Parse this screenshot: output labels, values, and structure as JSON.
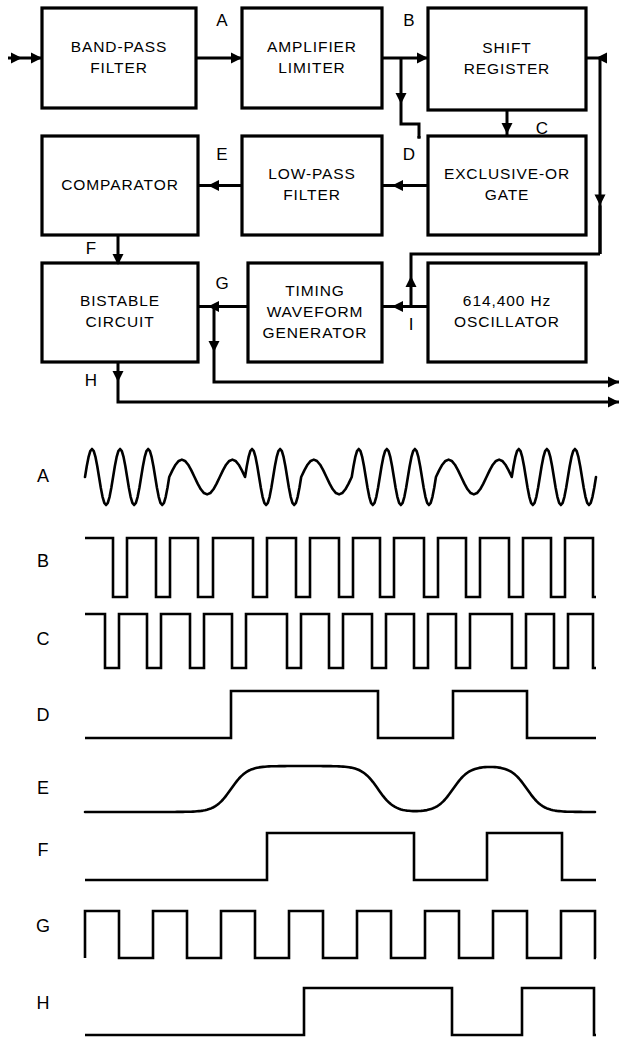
{
  "figure": {
    "kind": "block-diagram-with-timing-waveforms",
    "line_color": "#000000",
    "background_color": "#ffffff"
  },
  "block_diagram": {
    "blocks": [
      {
        "id": "band-pass-filter",
        "lines": [
          "BAND-PASS",
          "FILTER"
        ],
        "x": 42,
        "y": 8,
        "w": 154,
        "h": 100
      },
      {
        "id": "amplifier-limiter",
        "lines": [
          "AMPLIFIER",
          "LIMITER"
        ],
        "x": 242,
        "y": 8,
        "w": 140,
        "h": 100
      },
      {
        "id": "shift-register",
        "lines": [
          "SHIFT",
          "REGISTER"
        ],
        "x": 428,
        "y": 8,
        "w": 158,
        "h": 102
      },
      {
        "id": "comparator",
        "lines": [
          "COMPARATOR"
        ],
        "x": 42,
        "y": 136,
        "w": 156,
        "h": 99
      },
      {
        "id": "low-pass-filter",
        "lines": [
          "LOW-PASS",
          "FILTER"
        ],
        "x": 242,
        "y": 136,
        "w": 140,
        "h": 99
      },
      {
        "id": "exclusive-or-gate",
        "lines": [
          "EXCLUSIVE-OR",
          "GATE"
        ],
        "x": 428,
        "y": 136,
        "w": 158,
        "h": 99
      },
      {
        "id": "bistable-circuit",
        "lines": [
          "BISTABLE",
          "CIRCUIT"
        ],
        "x": 42,
        "y": 263,
        "w": 156,
        "h": 99
      },
      {
        "id": "timing-waveform-generator",
        "lines": [
          "TIMING",
          "WAVEFORM",
          "GENERATOR"
        ],
        "x": 248,
        "y": 263,
        "w": 134,
        "h": 99
      },
      {
        "id": "oscillator",
        "lines": [
          "614,400   Hz",
          "OSCILLATOR"
        ],
        "x": 428,
        "y": 263,
        "w": 158,
        "h": 99
      }
    ],
    "node_labels": [
      {
        "id": "node-a",
        "text": "A",
        "x": 222,
        "y": 22
      },
      {
        "id": "node-b",
        "text": "B",
        "x": 409,
        "y": 22
      },
      {
        "id": "node-c",
        "text": "C",
        "x": 542,
        "y": 130
      },
      {
        "id": "node-d",
        "text": "D",
        "x": 409,
        "y": 156
      },
      {
        "id": "node-e",
        "text": "E",
        "x": 222,
        "y": 156
      },
      {
        "id": "node-f",
        "text": "F",
        "x": 91,
        "y": 250
      },
      {
        "id": "node-g",
        "text": "G",
        "x": 222,
        "y": 285
      },
      {
        "id": "node-h",
        "text": "H",
        "x": 91,
        "y": 382
      },
      {
        "id": "node-i",
        "text": "I",
        "x": 411,
        "y": 326
      }
    ],
    "signal_flow": [
      "input → BAND-PASS FILTER",
      "BAND-PASS FILTER → A → AMPLIFIER LIMITER",
      "AMPLIFIER LIMITER → B → SHIFT REGISTER",
      "B → EXCLUSIVE-OR GATE",
      "SHIFT REGISTER → C → EXCLUSIVE-OR GATE",
      "EXCLUSIVE-OR GATE → D → LOW-PASS FILTER",
      "LOW-PASS FILTER → E → COMPARATOR",
      "COMPARATOR → F → BISTABLE CIRCUIT",
      "TIMING WAVEFORM GENERATOR → G → BISTABLE CIRCUIT",
      "614,400 Hz OSCILLATOR → I → TIMING WAVEFORM GENERATOR",
      "TIMING WAVEFORM GENERATOR → SHIFT REGISTER (clock)",
      "G → output",
      "BISTABLE CIRCUIT → H → output"
    ]
  },
  "waveforms": {
    "labels": [
      {
        "id": "wave-a",
        "text": "A",
        "x": 43,
        "y": 477
      },
      {
        "id": "wave-b",
        "text": "B",
        "x": 43,
        "y": 562
      },
      {
        "id": "wave-c",
        "text": "C",
        "x": 43,
        "y": 640
      },
      {
        "id": "wave-d",
        "text": "D",
        "x": 43,
        "y": 716
      },
      {
        "id": "wave-e",
        "text": "E",
        "x": 43,
        "y": 789
      },
      {
        "id": "wave-f",
        "text": "F",
        "x": 43,
        "y": 851
      },
      {
        "id": "wave-g",
        "text": "G",
        "x": 43,
        "y": 927
      },
      {
        "id": "wave-h",
        "text": "H",
        "x": 43,
        "y": 1004
      }
    ]
  },
  "chart_data": {
    "type": "line",
    "title": "",
    "xlabel": "",
    "ylabel": "",
    "x_range": [
      85,
      596
    ],
    "traces": [
      {
        "name": "A",
        "kind": "analog-sine-fsk",
        "baseline_y": 477,
        "amplitude": 28,
        "description": "Frequency-shift-keyed sine wave; alternating high-frequency and low-frequency bursts",
        "segments": [
          {
            "cycles": 3.0,
            "rel_freq": "high"
          },
          {
            "cycles": 1.5,
            "rel_freq": "low"
          },
          {
            "cycles": 2.0,
            "rel_freq": "high"
          },
          {
            "cycles": 1.0,
            "rel_freq": "low"
          },
          {
            "cycles": 3.0,
            "rel_freq": "high"
          },
          {
            "cycles": 1.5,
            "rel_freq": "low"
          },
          {
            "cycles": 3.0,
            "rel_freq": "high"
          }
        ]
      },
      {
        "name": "B",
        "kind": "digital",
        "low_y": 597,
        "high_y": 538,
        "description": "Squared-up limiter output, same timing as A",
        "transitions": [
          85,
          113,
          127,
          156,
          170,
          198,
          213,
          253,
          267,
          296,
          310,
          339,
          353,
          380,
          394,
          424,
          438,
          466,
          480,
          509,
          523,
          551,
          565,
          593
        ]
      },
      {
        "name": "C",
        "kind": "digital",
        "low_y": 668,
        "high_y": 614,
        "description": "Shift-register output: B delayed by one bit period",
        "transitions": [
          85,
          105,
          119,
          147,
          161,
          190,
          204,
          232,
          246,
          287,
          301,
          329,
          343,
          372,
          386,
          414,
          428,
          456,
          470,
          512,
          526,
          554,
          568,
          593
        ]
      },
      {
        "name": "D",
        "kind": "digital",
        "low_y": 738,
        "high_y": 691,
        "description": "Exclusive-OR gate output (phase comparison pulses)",
        "transitions": [
          231,
          378,
          453,
          527
        ]
      },
      {
        "name": "E",
        "kind": "analog-filtered",
        "low_y": 812,
        "high_y": 766,
        "description": "Low-pass filtered version of D; rounded rise and fall",
        "transitions": [
          231,
          378,
          453,
          527
        ]
      },
      {
        "name": "F",
        "kind": "digital",
        "low_y": 880,
        "high_y": 833,
        "description": "Comparator output: E re-squared by threshold detection",
        "transitions": [
          267,
          414,
          487,
          562
        ]
      },
      {
        "name": "G",
        "kind": "digital-clock",
        "low_y": 958,
        "high_y": 911,
        "description": "Timing waveform generator clock, uniform period",
        "period": 68,
        "duty": 0.5,
        "start_x": 85,
        "pulses": 7.5
      },
      {
        "name": "H",
        "kind": "digital",
        "low_y": 1035,
        "high_y": 988,
        "description": "Bistable circuit output: F retimed by clock G",
        "transitions": [
          304,
          452,
          522,
          594
        ]
      }
    ]
  }
}
